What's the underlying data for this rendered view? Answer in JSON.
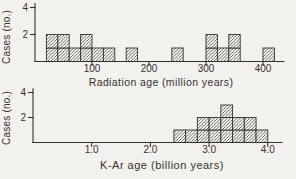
{
  "colors": {
    "ink": "#34322e",
    "background": "#f2f1ed",
    "cell_fill": "#faf9f5"
  },
  "chart_data": [
    {
      "type": "bar",
      "subtype": "histogram-of-cases",
      "ylabel": "Cases (no.)",
      "xlabel": "Radiation age (million years)",
      "yticks": [
        2,
        4
      ],
      "xticks": [
        {
          "value": 100,
          "label": "100"
        },
        {
          "value": 200,
          "label": "200"
        },
        {
          "value": 300,
          "label": "300"
        },
        {
          "value": 400,
          "label": "400"
        }
      ],
      "xlim": [
        0,
        437
      ],
      "ylim": [
        0,
        4.3
      ],
      "grid": false,
      "legend": "none",
      "hatch": "diagonal",
      "bin_width": 20,
      "bins": [
        {
          "start": 20,
          "count": 2
        },
        {
          "start": 40,
          "count": 2
        },
        {
          "start": 60,
          "count": 1
        },
        {
          "start": 80,
          "count": 2
        },
        {
          "start": 100,
          "count": 1
        },
        {
          "start": 120,
          "count": 1
        },
        {
          "start": 160,
          "count": 1
        },
        {
          "start": 240,
          "count": 1
        },
        {
          "start": 300,
          "count": 2
        },
        {
          "start": 320,
          "count": 1
        },
        {
          "start": 340,
          "count": 2
        },
        {
          "start": 400,
          "count": 1
        }
      ]
    },
    {
      "type": "bar",
      "subtype": "histogram-of-cases",
      "ylabel": "Cases (no.)",
      "xlabel": "K-Ar age  (billion years)",
      "yticks": [
        2,
        4
      ],
      "xticks": [
        {
          "value": 1,
          "label": "1.0"
        },
        {
          "value": 2,
          "label": "2.0"
        },
        {
          "value": 3,
          "label": "3.0"
        },
        {
          "value": 4,
          "label": "4.0"
        }
      ],
      "xlim": [
        0,
        4.25
      ],
      "ylim": [
        0,
        4.3
      ],
      "grid": false,
      "legend": "none",
      "hatch": "diagonal",
      "bin_width": 0.2,
      "bins": [
        {
          "start": 2.4,
          "count": 1
        },
        {
          "start": 2.6,
          "count": 1
        },
        {
          "start": 2.8,
          "count": 2
        },
        {
          "start": 3.0,
          "count": 2
        },
        {
          "start": 3.2,
          "count": 3
        },
        {
          "start": 3.4,
          "count": 2
        },
        {
          "start": 3.6,
          "count": 2
        },
        {
          "start": 3.8,
          "count": 1
        }
      ]
    }
  ]
}
